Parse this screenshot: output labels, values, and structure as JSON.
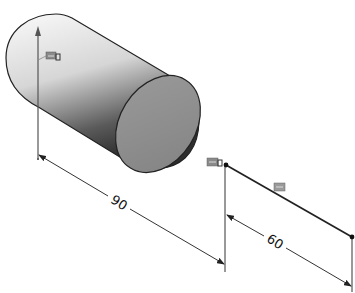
{
  "viewport": {
    "background": "#ffffff",
    "view": "isometric"
  },
  "model": {
    "feature": "cylinder",
    "body_colors": {
      "light": "#f4f4f4",
      "mid": "#bdbdbd",
      "dark": "#3a3a3a",
      "end_face": "#8c8c8c",
      "edge": "#222222"
    }
  },
  "sketch": {
    "line_color": "#222222",
    "relation_icon_color": "#8a8a8a"
  },
  "dimensions": [
    {
      "id": "length",
      "value": "90"
    },
    {
      "id": "sketch-length",
      "value": "60"
    }
  ],
  "relations": [
    {
      "id": "axis-relation",
      "icon": "horizontal-relation-icon"
    },
    {
      "id": "endpoint-relation",
      "icon": "horizontal-relation-icon"
    },
    {
      "id": "line-relation",
      "icon": "horizontal-relation-icon"
    }
  ]
}
